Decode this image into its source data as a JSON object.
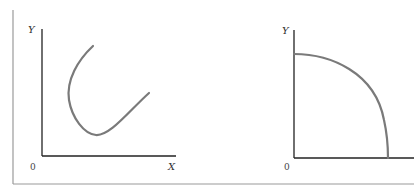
{
  "figure": {
    "left_panel": {
      "y_axis_label": "Y",
      "x_axis_label": "X",
      "origin_label": "0",
      "curve": "U-shaped curve (backward-bending then rising)",
      "line_color": "#7a7a7a",
      "axis_color": "#222222"
    },
    "right_panel": {
      "y_axis_label": "Y",
      "origin_label": "0",
      "curve": "concave quarter-circle arc from Y axis to X axis",
      "line_color": "#7a7a7a",
      "axis_color": "#222222"
    },
    "frame_color": "#999999"
  }
}
